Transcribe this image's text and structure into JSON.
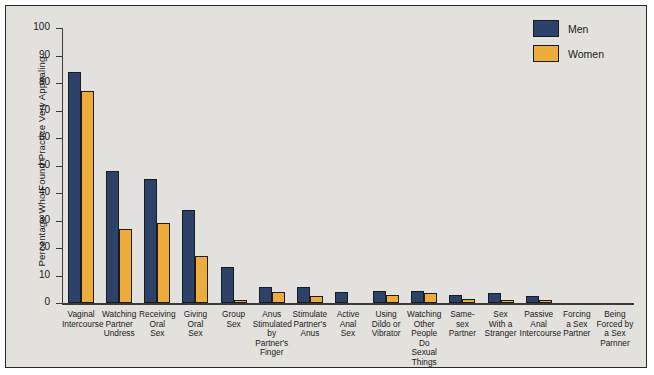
{
  "chart_data": {
    "type": "bar",
    "title": "",
    "xlabel": "",
    "ylabel": "Percentage Who Found Practice Very Appealing",
    "ylim": [
      0,
      100
    ],
    "yticks": [
      0,
      10,
      20,
      30,
      40,
      50,
      60,
      70,
      80,
      90,
      100
    ],
    "grid": false,
    "legend_position": "top-right",
    "categories": [
      "Vaginal Intercourse",
      "Watching Partner Undress",
      "Receiving Oral Sex",
      "Giving Oral Sex",
      "Group Sex",
      "Anus Stimulated by Partner's Finger",
      "Stimulate Partner's Anus",
      "Active Anal Sex",
      "Using Dildo or Vibrator",
      "Watching Other People Do Sexual Things",
      "Same-sex Partner",
      "Sex With a Stranger",
      "Passive Anal Intercourse",
      "Forcing a Sex Partner",
      "Being Forced by a Sex Parnner"
    ],
    "category_lines": [
      [
        "Vaginal",
        "Intercourse"
      ],
      [
        "Watching",
        "Partner",
        "Undress"
      ],
      [
        "Receiving",
        "Oral",
        "Sex"
      ],
      [
        "Giving",
        "Oral",
        "Sex"
      ],
      [
        "Group",
        "Sex"
      ],
      [
        "Anus",
        "Stimulated",
        "by Partner's",
        "Finger"
      ],
      [
        "Stimulate",
        "Partner's",
        "Anus"
      ],
      [
        "Active",
        "Anal",
        "Sex"
      ],
      [
        "Using",
        "Dildo or",
        "Vibrator"
      ],
      [
        "Watching",
        "Other",
        "People Do",
        "Sexual",
        "Things"
      ],
      [
        "Same-",
        "sex",
        "Partner"
      ],
      [
        "Sex",
        "With a",
        "Stranger"
      ],
      [
        "Passive",
        "Anal",
        "Intercourse"
      ],
      [
        "Forcing",
        "a Sex",
        "Partner"
      ],
      [
        "Being",
        "Forced by",
        "a Sex",
        "Parnner"
      ]
    ],
    "series": [
      {
        "name": "Men",
        "color": "#2d4268",
        "values": [
          84,
          48,
          45,
          34,
          13,
          6,
          6,
          4,
          4.5,
          4.5,
          3,
          3.5,
          2.5,
          0,
          0
        ]
      },
      {
        "name": "Women",
        "color": "#edad3c",
        "values": [
          77,
          27,
          29,
          17,
          1,
          4,
          2.5,
          0,
          3,
          3.5,
          1.5,
          1,
          1,
          0,
          0
        ]
      }
    ]
  },
  "legend": {
    "items": [
      {
        "label": "Men",
        "color": "#2d4268"
      },
      {
        "label": "Women",
        "color": "#edad3c"
      }
    ]
  }
}
